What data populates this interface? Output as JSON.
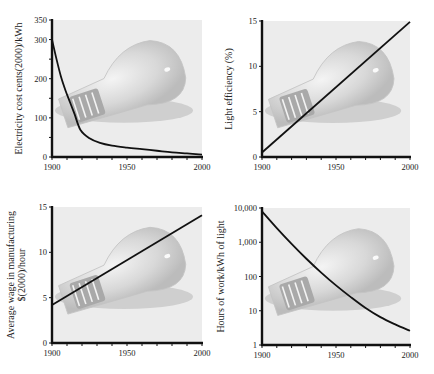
{
  "chart_data": [
    {
      "id": "electricity-cost",
      "type": "line",
      "title": "",
      "xlabel": "",
      "ylabel": "Electricity cost cents(2000)/kWh",
      "ylabel_lines": [
        "Electricity cost cents(2000)/kWh"
      ],
      "xlim": [
        1900,
        2000
      ],
      "ylim": [
        0,
        350
      ],
      "yscale": "linear",
      "xticks": [
        1900,
        1950,
        2000
      ],
      "xtick_labels": [
        "1900",
        "1950",
        "2000"
      ],
      "xminor_step": 10,
      "yticks": [
        0,
        100,
        200,
        300,
        350
      ],
      "ytick_labels": [
        "0",
        "100",
        "200",
        "300",
        "350"
      ],
      "yminor_step": 50,
      "grid": false,
      "background": "light bulb photograph",
      "series": [
        {
          "name": "Electricity cost",
          "x": [
            1900,
            1903,
            1906,
            1909,
            1912,
            1915,
            1919,
            1925,
            1932,
            1940,
            1950,
            1960,
            1970,
            1980,
            1990,
            2000
          ],
          "values": [
            300,
            250,
            205,
            170,
            140,
            110,
            69,
            48,
            36,
            29,
            24,
            20,
            16,
            12,
            9,
            6
          ]
        }
      ],
      "frame": {
        "x": 52,
        "y": 20,
        "w": 150,
        "h": 137
      }
    },
    {
      "id": "light-efficiency",
      "type": "line",
      "title": "",
      "xlabel": "",
      "ylabel": "Light efficiency (%)",
      "ylabel_lines": [
        "Light efficiency (%)"
      ],
      "xlim": [
        1900,
        2000
      ],
      "ylim": [
        0,
        15
      ],
      "yscale": "linear",
      "xticks": [
        1900,
        1950,
        2000
      ],
      "xtick_labels": [
        "1900",
        "1950",
        "2000"
      ],
      "xminor_step": 10,
      "yticks": [
        0,
        5,
        10,
        15
      ],
      "ytick_labels": [
        "0",
        "5",
        "10",
        "15"
      ],
      "yminor_step": 5,
      "grid": false,
      "background": "light bulb photograph",
      "series": [
        {
          "name": "Light efficiency",
          "x": [
            1900,
            2000
          ],
          "values": [
            0.5,
            14.9
          ]
        }
      ],
      "frame": {
        "x": 262,
        "y": 21,
        "w": 148,
        "h": 136
      }
    },
    {
      "id": "average-wage",
      "type": "line",
      "title": "",
      "xlabel": "",
      "ylabel": "Average wage in manufacturing $(2000)/hour",
      "ylabel_lines": [
        "Average wage in manufacturing",
        "$(2000)/hour"
      ],
      "xlim": [
        1900,
        2000
      ],
      "ylim": [
        0,
        15
      ],
      "yscale": "linear",
      "xticks": [
        1900,
        1950,
        2000
      ],
      "xtick_labels": [
        "1900",
        "1950",
        "2000"
      ],
      "xminor_step": 10,
      "yticks": [
        0,
        5,
        10,
        15
      ],
      "ytick_labels": [
        "0",
        "5",
        "10",
        "15"
      ],
      "yminor_step": 5,
      "grid": false,
      "background": "light bulb photograph",
      "series": [
        {
          "name": "Average wage",
          "x": [
            1900,
            2000
          ],
          "values": [
            4.2,
            14.1
          ]
        }
      ],
      "frame": {
        "x": 52,
        "y": 207,
        "w": 150,
        "h": 136
      }
    },
    {
      "id": "hours-of-work",
      "type": "line",
      "title": "",
      "xlabel": "",
      "ylabel": "Hours of work/kWh of light",
      "ylabel_lines": [
        "Hours of work/kWh of light"
      ],
      "xlim": [
        1900,
        2000
      ],
      "ylim": [
        1,
        10000
      ],
      "yscale": "log",
      "xticks": [
        1900,
        1950,
        2000
      ],
      "xtick_labels": [
        "1900",
        "1950",
        "2000"
      ],
      "xminor_step": 10,
      "yticks": [
        1,
        10,
        100,
        1000,
        10000
      ],
      "ytick_labels": [
        "1",
        "10",
        "100",
        "1,000",
        "10,000"
      ],
      "grid": false,
      "background": "light bulb photograph",
      "series": [
        {
          "name": "Hours of work",
          "x": [
            1900,
            1910,
            1920,
            1930,
            1940,
            1950,
            1960,
            1970,
            1980,
            1990,
            2000
          ],
          "values": [
            8000,
            2600,
            900,
            330,
            130,
            55,
            25,
            12,
            6.5,
            4,
            2.6
          ]
        }
      ],
      "frame": {
        "x": 262,
        "y": 208,
        "w": 148,
        "h": 137
      }
    }
  ]
}
